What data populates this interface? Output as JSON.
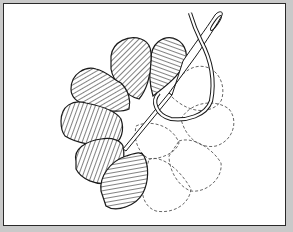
{
  "figure": {
    "stitched_petals": 7,
    "unstitched_petals": 5,
    "elements": [
      "needle",
      "thread-loop",
      "hatched-petals",
      "dashed-petal-outlines"
    ]
  },
  "colors": {
    "background_margin": "#c9c9c9",
    "frame_border": "#2a2a2a",
    "canvas": "#ffffff",
    "ink": "#1a1a1a",
    "dashed_outline": "#555555"
  }
}
